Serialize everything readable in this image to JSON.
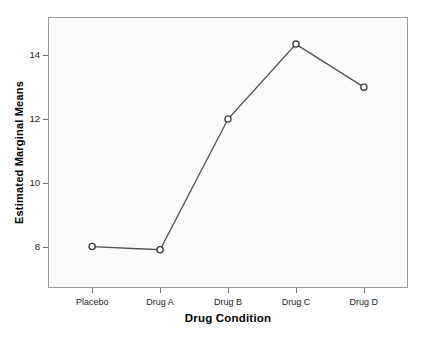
{
  "chart_data": {
    "type": "line",
    "title": "",
    "subtitle": "",
    "xlabel": "Drug Condition",
    "ylabel": "Estimated Marginal Means",
    "categories": [
      "Placebo",
      "Drug A",
      "Drug B",
      "Drug C",
      "Drug D"
    ],
    "values": [
      8.0,
      7.9,
      12.0,
      14.35,
      13.0
    ],
    "series": [
      {
        "name": "Estimated Marginal Means",
        "values": [
          8.0,
          7.9,
          12.0,
          14.35,
          13.0
        ]
      }
    ],
    "ylim": [
      6.7,
      15.2
    ],
    "yticks": [
      8,
      10,
      12,
      14
    ],
    "ytick_labels": [
      "8",
      "10",
      "12",
      "14"
    ],
    "xtick_labels": [
      "Placebo",
      "Drug A",
      "Drug B",
      "Drug C",
      "Drug D"
    ],
    "grid": false,
    "legend": false,
    "legend_position": "none",
    "marker": "open-circle",
    "line_color": "#4f4f4f",
    "marker_fill_color": "#ffffff",
    "marker_edge_color": "#3c3c3c",
    "plot_background_color": "#fbfbfb",
    "frame_color": "#9a9a9a",
    "page_background_color": "#ffffff",
    "axis_title_color": "#000000",
    "tick_label_color": "#1a1a1a"
  }
}
